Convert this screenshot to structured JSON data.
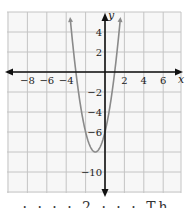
{
  "chart_data": {
    "type": "line",
    "title": "",
    "function": "y = 2x^2 + 4x - 6",
    "series": [
      {
        "name": "parabola",
        "color": "#8a8a8a",
        "x": [
          -3.55,
          -3,
          -2.5,
          -2,
          -1.5,
          -1,
          -0.5,
          0,
          0.5,
          1,
          1.55
        ],
        "y": [
          5.0,
          0,
          -3.5,
          -6,
          -7.5,
          -8,
          -7.5,
          -6,
          -3.5,
          0,
          5.0
        ]
      }
    ],
    "vertex": [
      -1,
      -8
    ],
    "x_intercepts": [
      -3,
      1
    ],
    "y_intercept": -6,
    "xlabel": "x",
    "ylabel": "y",
    "x_ticks": [
      "−8",
      "−6",
      "−4",
      "2",
      "4",
      "6"
    ],
    "x_tick_values": [
      -8,
      -6,
      -4,
      2,
      4,
      6
    ],
    "y_ticks": [
      "4",
      "2",
      "−2",
      "−4",
      "−6",
      "−10"
    ],
    "y_tick_values": [
      4,
      2,
      -2,
      -4,
      -6,
      -10
    ],
    "xlim": [
      -10,
      8
    ],
    "ylim": [
      -12,
      6
    ],
    "grid": true,
    "grid_step": 2,
    "legend": null
  },
  "colors": {
    "grid": "#c4c4c4",
    "axes": "#111111",
    "curve": "#8a8a8a",
    "plot_bg": "#f7f7f7"
  },
  "footer_text": "· · ·  · 2 ·  · · Th"
}
